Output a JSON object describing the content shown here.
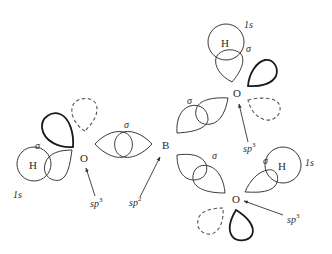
{
  "diagram": {
    "title": "",
    "colors": {
      "line": "#3a3a3a",
      "bold_line": "#1a1a1a",
      "dashed_line": "#555555",
      "background": "#ffffff"
    },
    "atoms": {
      "boron": "B",
      "oxygen_left": "O",
      "oxygen_top": "O",
      "oxygen_bottom": "O",
      "hydrogen_left": "H",
      "hydrogen_top": "H",
      "hydrogen_bottom": "H"
    },
    "labels": {
      "sigma_left": "σ",
      "sigma_center": "σ",
      "sigma_top": "σ",
      "sigma_upper_right": "σ",
      "sigma_lower_right": "σ",
      "sigma_bottom": "σ",
      "orbital_1s_left": "1s",
      "orbital_1s_top": "1s",
      "orbital_1s_bottom": "1s",
      "hybrid_sp3_left": "sp",
      "hybrid_sp3_left_sup": "3",
      "hybrid_sp2": "sp",
      "hybrid_sp2_sup": "2",
      "hybrid_sp3_top": "sp",
      "hybrid_sp3_top_sup": "3",
      "hybrid_sp3_bottom": "sp",
      "hybrid_sp3_bottom_sup": "3"
    }
  }
}
